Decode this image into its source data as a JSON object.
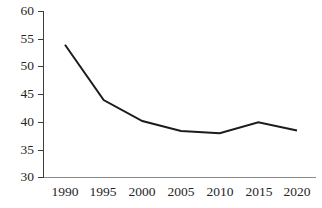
{
  "chart_data": {
    "type": "line",
    "title": "",
    "subtitle": "",
    "xlabel": "",
    "ylabel": "",
    "categories": [
      "1990",
      "1995",
      "2000",
      "2005",
      "2010",
      "2015",
      "2020"
    ],
    "x": [
      1990,
      1995,
      2000,
      2005,
      2010,
      2015,
      2020
    ],
    "values": [
      54.0,
      44.0,
      40.2,
      38.4,
      38.0,
      40.0,
      38.5
    ],
    "series": [
      {
        "name": "",
        "values": [
          54.0,
          44.0,
          40.2,
          38.4,
          38.0,
          40.0,
          38.5
        ],
        "color": "#1c1c1c"
      }
    ],
    "ylim": [
      30,
      60
    ],
    "xlim": [
      1990,
      2020
    ],
    "yticks": [
      30,
      35,
      40,
      45,
      50,
      55,
      60
    ],
    "ytick_labels": [
      "30",
      "35",
      "40",
      "45",
      "50",
      "55",
      "60"
    ],
    "xtick_labels": [
      "1990",
      "1995",
      "2000",
      "2005",
      "2010",
      "2015",
      "2020"
    ],
    "grid": false,
    "legend": false,
    "legend_position": "none",
    "annotations": [],
    "axis_color": "#3d3d3d",
    "xaxis_color": "#8a8a8a",
    "line_color": "#1c1c1c",
    "background_color": "#ffffff"
  },
  "axes": {
    "y_axis_name": "value-axis",
    "x_axis_name": "year-axis"
  }
}
